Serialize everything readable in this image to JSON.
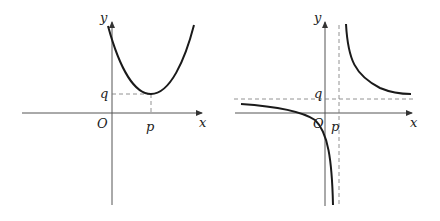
{
  "graphs": [
    {
      "name": "parabola",
      "description": "upward parabola with vertex at (p, q) in first quadrant",
      "labels": {
        "y": "y",
        "x": "x",
        "origin": "O",
        "p": "p",
        "q": "q"
      }
    },
    {
      "name": "hyperbola",
      "description": "hyperbola with vertical asymptote x = p and horizontal asymptote y = q",
      "labels": {
        "y": "y",
        "x": "x",
        "origin": "O",
        "p": "p",
        "q": "q"
      }
    }
  ]
}
